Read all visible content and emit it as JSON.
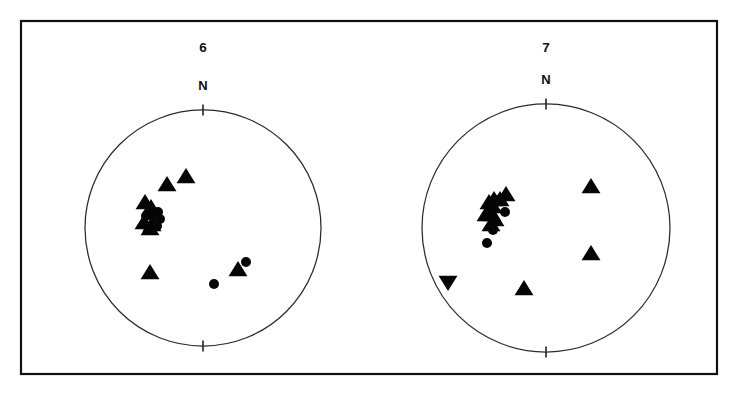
{
  "figure": {
    "title": "",
    "background_color": "#ffffff",
    "ink_color": "#050505",
    "frame": {
      "x": 20,
      "y": 20,
      "width": 698,
      "height": 355
    }
  },
  "chart_data": {
    "type": "scatter",
    "title": "",
    "subtitle": "",
    "xlabel": "",
    "ylabel": "",
    "projection": "stereonet-equal-area-lower-hemisphere",
    "grid": false,
    "legend_position": "none",
    "panels": [
      {
        "label": "6",
        "north_label": "N",
        "center": {
          "x": 203,
          "y": 228
        },
        "radius": 118,
        "tick_length": 11,
        "ticks": [
          "top",
          "bottom"
        ],
        "n_points": 17,
        "series": [
          {
            "name": "triangle-up",
            "marker": "triangle-up",
            "size": 9,
            "points": [
              {
                "x": 167,
                "y": 184
              },
              {
                "x": 186,
                "y": 176
              },
              {
                "x": 145,
                "y": 202
              },
              {
                "x": 151,
                "y": 207
              },
              {
                "x": 144,
                "y": 222
              },
              {
                "x": 152,
                "y": 224
              },
              {
                "x": 150,
                "y": 228
              },
              {
                "x": 150,
                "y": 272
              },
              {
                "x": 238,
                "y": 269
              }
            ]
          },
          {
            "name": "circle",
            "marker": "circle",
            "size": 5,
            "points": [
              {
                "x": 158,
                "y": 212
              },
              {
                "x": 151,
                "y": 215
              },
              {
                "x": 146,
                "y": 216
              },
              {
                "x": 155,
                "y": 216
              },
              {
                "x": 160,
                "y": 219
              },
              {
                "x": 157,
                "y": 226
              },
              {
                "x": 214,
                "y": 284
              },
              {
                "x": 246,
                "y": 262
              }
            ]
          }
        ]
      },
      {
        "label": "7",
        "north_label": "N",
        "center": {
          "x": 546,
          "y": 228
        },
        "radius": 124,
        "tick_length": 11,
        "ticks": [
          "top",
          "bottom"
        ],
        "n_points": 19,
        "series": [
          {
            "name": "triangle-up",
            "marker": "triangle-up",
            "size": 9,
            "points": [
              {
                "x": 506,
                "y": 194
              },
              {
                "x": 500,
                "y": 199
              },
              {
                "x": 494,
                "y": 199
              },
              {
                "x": 489,
                "y": 202
              },
              {
                "x": 493,
                "y": 206
              },
              {
                "x": 486,
                "y": 214
              },
              {
                "x": 492,
                "y": 214
              },
              {
                "x": 495,
                "y": 219
              },
              {
                "x": 491,
                "y": 224
              },
              {
                "x": 591,
                "y": 186
              },
              {
                "x": 591,
                "y": 253
              },
              {
                "x": 524,
                "y": 288
              }
            ]
          },
          {
            "name": "triangle-down",
            "marker": "triangle-down",
            "size": 9,
            "points": [
              {
                "x": 448,
                "y": 283
              }
            ]
          },
          {
            "name": "circle",
            "marker": "circle",
            "size": 5,
            "points": [
              {
                "x": 496,
                "y": 200
              },
              {
                "x": 490,
                "y": 203
              },
              {
                "x": 505,
                "y": 212
              },
              {
                "x": 494,
                "y": 221
              },
              {
                "x": 493,
                "y": 230
              },
              {
                "x": 487,
                "y": 243
              }
            ]
          }
        ]
      }
    ]
  }
}
